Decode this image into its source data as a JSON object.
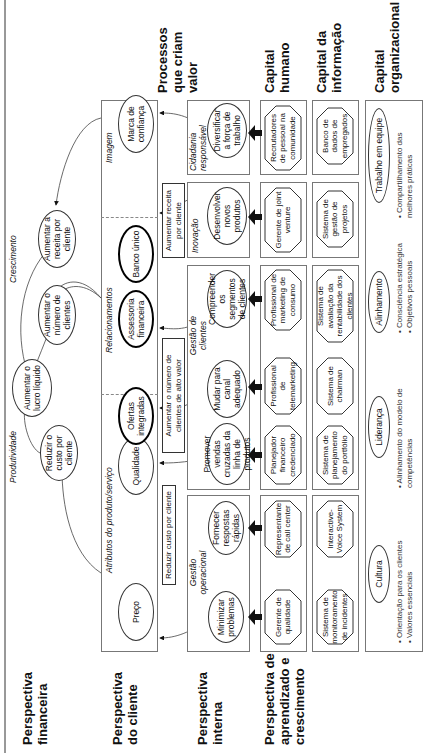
{
  "perspectives": {
    "financial": "Perspectiva financeira",
    "customer": "Perspectiva do cliente",
    "internal": "Perspectiva interna",
    "learning": "Perspectiva de aprendizado e crescimento"
  },
  "financial": {
    "productivity_label": "Produtividade",
    "growth_label": "Crescimento",
    "net_profit": "Aumentar o lucro líquido",
    "reduce_cost": "Reduzir o custo por cliente",
    "increase_clients": "Aumentar o número de clientes",
    "increase_revenue": "Aumentar a receita por cliente"
  },
  "customer": {
    "attributes_label": "Atributos do produto/serviço",
    "relationships_label": "Relacionamentos",
    "image_label": "Imagem",
    "price": "Preço",
    "quality": "Qualidade",
    "integrated_offers": "Ofertas integradas",
    "financial_advisory": "Assessoria financeira",
    "single_bank": "Banco único",
    "trusted_brand": "Marca de confiança"
  },
  "tags": {
    "reduce_cost": "Reduzir custo por cliente",
    "high_value_clients": "Aumentar o número de clientes de alto valor",
    "revenue_per_client": "Aumentar receita por cliente"
  },
  "processes": {
    "header": "Processos que criam valor",
    "operational_label": "Gestão operacional",
    "customer_mgmt_label": "Gestão de clientes",
    "innovation_label": "Inovação",
    "citizenship_label": "Cidadania responsável",
    "minimize_problems": "Minimizar problemas",
    "fast_responses": "Fornecer respostas rápidas",
    "cross_sell": "Promover vendas cruzadas da linha de produtos",
    "change_channel": "Mudar para canal adequado",
    "understand_segments": "Compreender os segmentos de clientes",
    "new_products": "Desenvolver novos produtos",
    "diversify_workforce": "Diversificar a força de trabalho"
  },
  "human_capital": {
    "header": "Capital humano",
    "quality_manager": "Gerente de qualidade",
    "call_center_rep": "Representante de call center",
    "financial_planner": "Planejador financeiro credenciado",
    "telemarketing": "Profissional de telemarketing",
    "consumer_marketing": "Profissional de marketing de consumo",
    "jv_manager": "Gerente de joint venture",
    "recruiters": "Recrutadores de pessoal na comunidade"
  },
  "information_capital": {
    "header": "Capital da informação",
    "incident_monitoring": "Sistema de monitoramento de incidentes",
    "ivr": "Interactive-Voice System",
    "portfolio_planning": "Sistema de planejamento do portfólio",
    "chairman": "Sistema de chairman",
    "profitability": "Sistema de avaliação da rentabilidade dos clientes",
    "project_mgmt": "Sistema de gestão de projetos",
    "employee_db": "Banco de dados de empregados"
  },
  "organizational_capital": {
    "header": "Capital organizacional",
    "culture": "Cultura",
    "culture_bullets": [
      "• Orientação para os clientes",
      "• Valores essenciais"
    ],
    "leadership": "Liderança",
    "leadership_bullets": [
      "• Alinhamento do modelo de competências"
    ],
    "alignment": "Alinhamento",
    "alignment_bullets": [
      "• Consciência estratégica",
      "• Objetivos pessoais"
    ],
    "teamwork": "Trabalho em equipe",
    "teamwork_bullets": [
      "• Compartilhamento das melhores práticas"
    ]
  }
}
